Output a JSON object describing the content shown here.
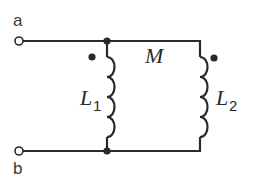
{
  "diagram": {
    "type": "circuit",
    "terminals": [
      {
        "label": "a"
      },
      {
        "label": "b"
      }
    ],
    "inductors": [
      {
        "symbol": "L",
        "subscript": "1"
      },
      {
        "symbol": "L",
        "subscript": "2"
      }
    ],
    "mutual_inductance": {
      "label": "M"
    },
    "dot_convention": "dots at top of both inductors",
    "colors": {
      "line": "#2a2a2a",
      "background": "#ffffff"
    }
  }
}
